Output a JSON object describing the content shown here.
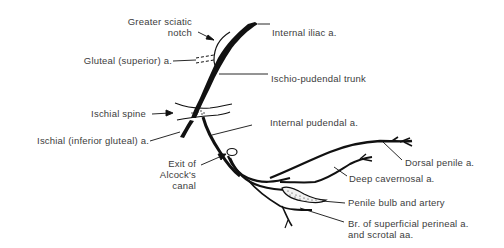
{
  "diagram": {
    "type": "anatomical-illustration",
    "colors": {
      "vessel": "#111111",
      "text": "#3c3c3c",
      "background": "#ffffff"
    },
    "labels": {
      "greater_sciatic_notch_line1": "Greater sciatic",
      "greater_sciatic_notch_line2": "notch",
      "internal_iliac": "Internal iliac a.",
      "gluteal_superior": "Gluteal (superior) a.",
      "ischio_pudendal_trunk": "Ischio-pudendal trunk",
      "ischial_spine": "Ischial spine",
      "ischial_inferior_gluteal": "Ischial (inferior gluteal) a.",
      "internal_pudendal": "Internal pudendal a.",
      "exit_alcock_line1": "Exit of",
      "exit_alcock_line2": "Alcock's",
      "exit_alcock_line3": "canal",
      "dorsal_penile": "Dorsal penile a.",
      "deep_cavernosal": "Deep cavernosal a.",
      "penile_bulb": "Penile bulb and artery",
      "superficial_perineal_line1": "Br. of superficial perineal a.",
      "superficial_perineal_line2": "and scrotal aa."
    }
  }
}
